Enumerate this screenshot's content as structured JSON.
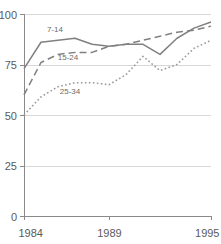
{
  "chart_data": {
    "type": "line",
    "title": "",
    "xlabel": "",
    "ylabel": "",
    "xlim": [
      1984,
      1995
    ],
    "ylim": [
      0,
      100
    ],
    "grid": true,
    "grid_axis": "y",
    "legend": "inline-labels",
    "x": [
      1984,
      1985,
      1986,
      1987,
      1988,
      1989,
      1990,
      1991,
      1992,
      1993,
      1994,
      1995
    ],
    "x_tick_labels": [
      "1984",
      "1989",
      "1995"
    ],
    "x_tick_values": [
      1984,
      1989,
      1995
    ],
    "y_tick_labels": [
      "0",
      "25",
      "50",
      "75",
      "100"
    ],
    "y_tick_values": [
      0,
      25,
      50,
      75,
      100
    ],
    "series": [
      {
        "name": "7-14",
        "label": "7-14",
        "style": "solid",
        "color": "#808080",
        "values": [
          73,
          86,
          87,
          88,
          85,
          84,
          85,
          85,
          80,
          88,
          93,
          96
        ]
      },
      {
        "name": "15-24",
        "label": "15-24",
        "style": "dashed",
        "color": "#808080",
        "values": [
          60,
          76,
          80,
          81,
          81,
          84,
          85,
          87,
          89,
          91,
          92,
          94
        ]
      },
      {
        "name": "25-34",
        "label": "25-34",
        "style": "dotted",
        "color": "#9a9a9a",
        "values": [
          50,
          59,
          64,
          66,
          66,
          65,
          70,
          79,
          72,
          75,
          83,
          87
        ]
      }
    ],
    "series_label_positions": [
      {
        "name": "7-14",
        "x": 55,
        "y": 32
      },
      {
        "name": "15-24",
        "x": 68,
        "y": 60
      },
      {
        "name": "25-34",
        "x": 70,
        "y": 94
      }
    ]
  },
  "axis": {
    "x_start_px": 24,
    "x_end_px": 211,
    "y_zero_px": 216,
    "y_top_px": 14
  },
  "colors": {
    "background": "#ffffff",
    "gridline": "#d8d8d8",
    "axis": "#8a8a8a",
    "tick_text": "#5a5a5a",
    "series_label": "#6b6b6b"
  }
}
